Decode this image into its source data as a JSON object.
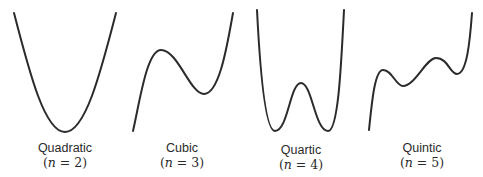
{
  "figure": {
    "stroke_color": "#2b2b2b",
    "background": "#ffffff",
    "panels": [
      {
        "id": "quadratic",
        "name": "Quadratic",
        "degree_label": "(n = 2)",
        "n": "n",
        "eq": "=",
        "value": "2",
        "path": "M14,13 C30,75 45,132 65,132 C85,132 100,75 116,13",
        "label_x": 10,
        "label_y": 141
      },
      {
        "id": "cubic",
        "name": "Cubic",
        "degree_label": "(n = 3)",
        "n": "n",
        "eq": "=",
        "value": "3",
        "path": "M133,131 C140,100 147,50 161,50 C178,50 190,94 204,94 C220,94 228,40 233,13",
        "label_x": 127,
        "label_y": 141
      },
      {
        "id": "quartic",
        "name": "Quartic",
        "degree_label": "(n = 4)",
        "n": "n",
        "eq": "=",
        "value": "4",
        "path": "M257,10 C260,70 265,131 275,131 C288,131 290,83 301,83 C312,83 315,131 328,131 C338,131 341,70 344,10",
        "label_x": 246,
        "label_y": 143
      },
      {
        "id": "quintic",
        "name": "Quintic",
        "degree_label": "(n = 5)",
        "n": "n",
        "eq": "=",
        "value": "5",
        "path": "M369,130 C372,100 375,70 383,70 C392,70 396,86 403,86 C415,86 426,58 436,58 C448,58 450,74 457,74 C467,74 470,40 472,13",
        "label_x": 367,
        "label_y": 141
      }
    ]
  }
}
